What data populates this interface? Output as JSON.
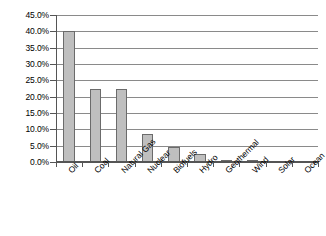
{
  "chart_data": {
    "type": "bar",
    "title": "",
    "subtitle": "",
    "xlabel": "",
    "ylabel": "",
    "categories": [
      "Oil",
      "Coal",
      "Natural Gas",
      "Nuclear",
      "Biofuels",
      "Hydro",
      "Geothermal",
      "Wind",
      "Solar",
      "Ocean"
    ],
    "values": [
      40.0,
      22.5,
      22.5,
      8.5,
      4.5,
      2.5,
      0.4,
      0.3,
      0.05,
      0.0
    ],
    "value_unit": "%",
    "ylim": [
      0.0,
      45.0
    ],
    "ytick_values": [
      0.0,
      5.0,
      10.0,
      15.0,
      20.0,
      25.0,
      30.0,
      35.0,
      40.0,
      45.0
    ],
    "ytick_labels": [
      "0.0%",
      "5.0%",
      "10.0%",
      "15.0%",
      "20.0%",
      "25.0%",
      "30.0%",
      "35.0%",
      "40.0%",
      "45.0%"
    ],
    "grid": true,
    "grid_axis": "y",
    "legend": false,
    "legend_position": "none",
    "series": [
      {
        "name": "Share of world energy supply",
        "values": [
          40.0,
          22.5,
          22.5,
          8.5,
          4.5,
          2.5,
          0.4,
          0.3,
          0.05,
          0.0
        ]
      }
    ],
    "colors": {
      "bar_fill": "#bfbfbf",
      "bar_edge": "#6b6b6b",
      "gridline": "#8a8a8a",
      "axis": "#555555",
      "background": "#ffffff",
      "text": "#000000"
    }
  }
}
